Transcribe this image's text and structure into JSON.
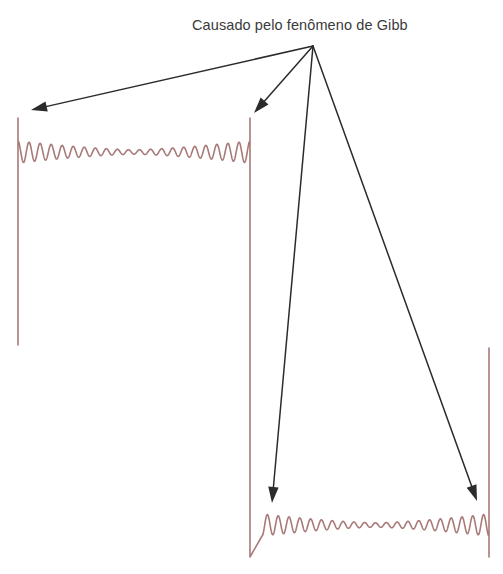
{
  "figure": {
    "caption": "Causado pelo fenômeno de Gibb",
    "background_color": "#ffffff",
    "caption_color": "#3a3a3a"
  },
  "chart_data": {
    "type": "line",
    "title": "Causado pelo fenômeno de Gibb",
    "xlabel": "",
    "ylabel": "",
    "grid": false,
    "legend": null,
    "axis_visible": false,
    "tick_labels": [],
    "series": [
      {
        "name": "square-wave-partial-sum",
        "color": "#a87a78",
        "line_width": 1.6,
        "harmonics": 21,
        "ripple_cycles": 21,
        "segments": [
          {
            "name": "top-plateau",
            "level": "high",
            "x_start": 18,
            "x_end": 250,
            "baseline_y": 152,
            "overshoot_peak_y": 118,
            "ripple_amplitude": 11,
            "ripple_decay": 0.72
          },
          {
            "name": "falling-edge",
            "x": 250,
            "y_from": 118,
            "y_to": 557
          },
          {
            "name": "bottom-plateau",
            "level": "low",
            "x_start": 262,
            "x_end": 489,
            "baseline_y": 525,
            "undershoot_trough_y": 557,
            "ripple_amplitude": 11,
            "ripple_decay": 0.72
          },
          {
            "name": "left-open-edge",
            "x": 18,
            "y_from": 118,
            "y_to": 345
          },
          {
            "name": "right-open-edge",
            "x": 489,
            "y_from": 557,
            "y_to": 348
          }
        ]
      }
    ]
  },
  "annotations": {
    "color": "#2b2b2b",
    "line_width": 1.5,
    "origin": {
      "x": 313,
      "y": 46
    },
    "arrows": [
      {
        "name": "arrow-to-top-left-overshoot",
        "label": "Causado pelo fenômeno de Gibb",
        "from_x": 313,
        "from_y": 46,
        "to_x": 31,
        "to_y": 110,
        "target": "top-left overshoot spike"
      },
      {
        "name": "arrow-to-top-right-overshoot",
        "label": "Causado pelo fenômeno de Gibb",
        "from_x": 313,
        "from_y": 46,
        "to_x": 254,
        "to_y": 113,
        "target": "top-right overshoot spike"
      },
      {
        "name": "arrow-to-bottom-left-undershoot",
        "label": "Causado pelo fenômeno de Gibb",
        "from_x": 313,
        "from_y": 46,
        "to_x": 272,
        "to_y": 503,
        "target": "bottom-left undershoot spike"
      },
      {
        "name": "arrow-to-bottom-right-undershoot",
        "label": "Causado pelo fenômeno de Gibb",
        "from_x": 313,
        "from_y": 46,
        "to_x": 477,
        "to_y": 501,
        "target": "bottom-right undershoot spike"
      }
    ]
  }
}
